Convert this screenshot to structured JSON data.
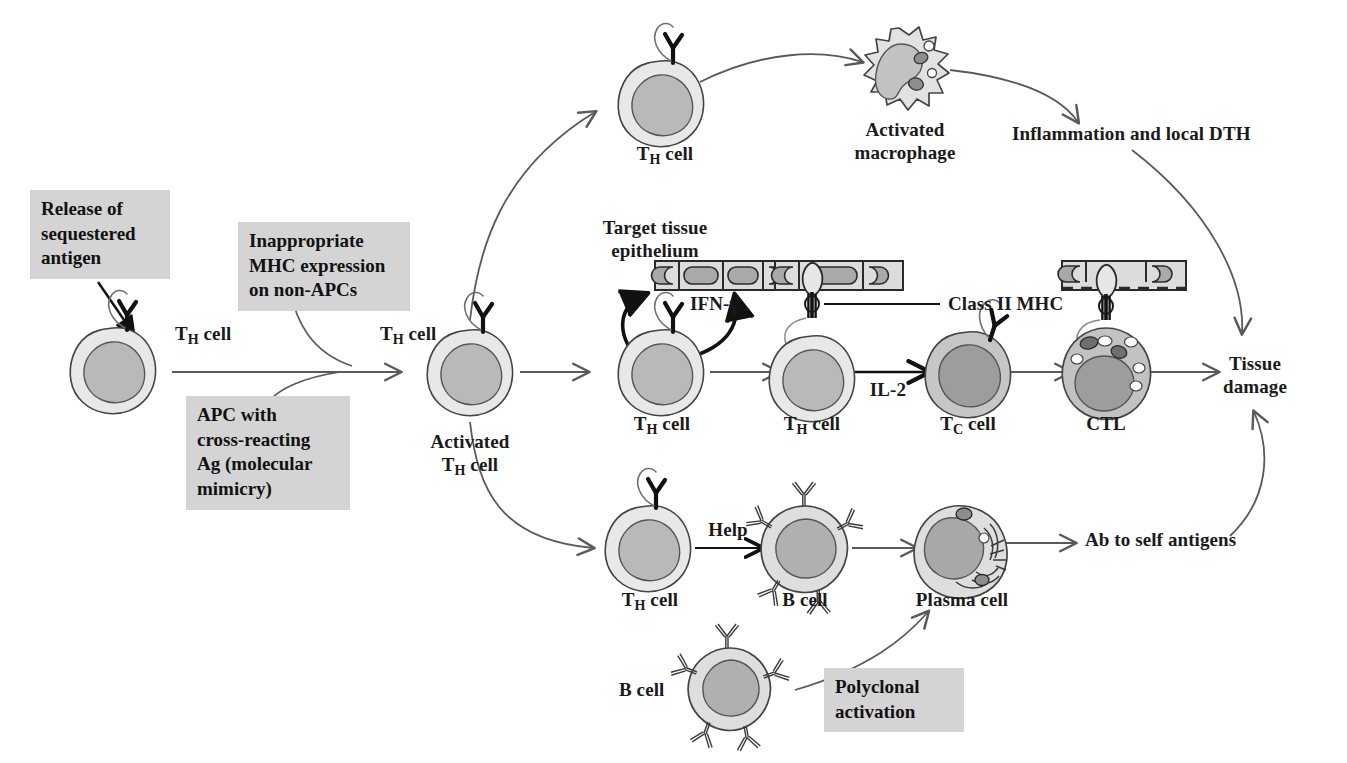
{
  "diagram": {
    "colors": {
      "box_fill": "#d4d4d4",
      "cytoplasm_light": "#e8e8e6",
      "cytoplasm_mid": "#cfcfcd",
      "nucleus_mid": "#b9b9b7",
      "nucleus_dark": "#a2a2a0",
      "outline": "#3a3a3a",
      "arrow": "#5a5a5a",
      "arrow_dark": "#111111",
      "text": "#1a1a1a"
    }
  },
  "callouts": [
    {
      "id": "release-sequestered-antigen",
      "text": "Release of\nsequestered\nantigen"
    },
    {
      "id": "inappropriate-mhc",
      "text": "Inappropriate\nMHC expression\non non-APCs"
    },
    {
      "id": "apc-cross-reacting",
      "text": "APC with\ncross-reacting\nAg (molecular\nmimicry)"
    },
    {
      "id": "polyclonal-activation",
      "text": "Polyclonal\nactivation"
    }
  ],
  "cell_labels": {
    "th_cell_start": {
      "pre": "T",
      "sub": "H",
      "post": " cell"
    },
    "th_cell_mid": {
      "pre": "T",
      "sub": "H",
      "post": " cell"
    },
    "activated_th": {
      "line1": "Activated",
      "pre": "T",
      "sub": "H",
      "post": " cell"
    },
    "th_cell_top": {
      "pre": "T",
      "sub": "H",
      "post": " cell"
    },
    "th_cell_ifn": {
      "pre": "T",
      "sub": "H",
      "post": " cell"
    },
    "th_cell_mhc": {
      "pre": "T",
      "sub": "H",
      "post": " cell"
    },
    "tc_cell": {
      "pre": "T",
      "sub": "C",
      "post": " cell"
    },
    "ctl": {
      "text": "CTL"
    },
    "th_cell_bottom": {
      "pre": "T",
      "sub": "H",
      "post": " cell"
    },
    "b_cell_help": {
      "text": "B cell"
    },
    "plasma_cell": {
      "text": "Plasma cell"
    },
    "b_cell_poly": {
      "text": "B cell"
    },
    "activated_macrophage": {
      "line1": "Activated",
      "line2": "macrophage"
    }
  },
  "annotations": {
    "target_tissue_epithelium": "Target tissue\nepithelium",
    "ifn_gamma": "IFN-γ",
    "class_ii_mhc": "Class II MHC",
    "il_2": "IL-2",
    "help": "Help",
    "inflammation_dth": "Inflammation and local DTH",
    "ab_to_self_antigens": "Ab to self antigens",
    "tissue_damage": "Tissue\ndamage"
  }
}
